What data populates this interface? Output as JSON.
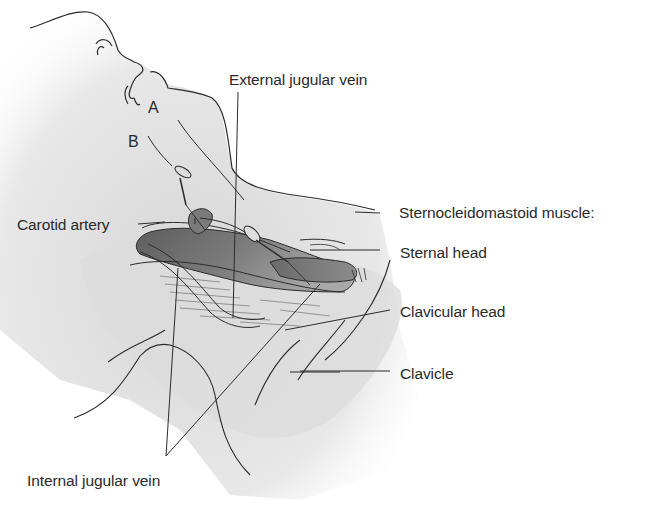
{
  "figure": {
    "labels": {
      "external_jugular_vein": "External jugular vein",
      "carotid_artery": "Carotid artery",
      "scm_muscle": "Sternocleidomastoid muscle:",
      "sternal_head": "Sternal head",
      "clavicular_head": "Clavicular head",
      "clavicle": "Clavicle",
      "internal_jugular_vein": "Internal jugular vein"
    },
    "approaches": {
      "a": "A",
      "b": "B"
    }
  },
  "colors": {
    "background": "#ffffff",
    "skin_shade": "#e6e6e6",
    "muscle_dark": "#6e6e6e",
    "muscle_mid": "#9a9a9a",
    "line": "#2b2b2b",
    "text": "#2a2a2a"
  }
}
